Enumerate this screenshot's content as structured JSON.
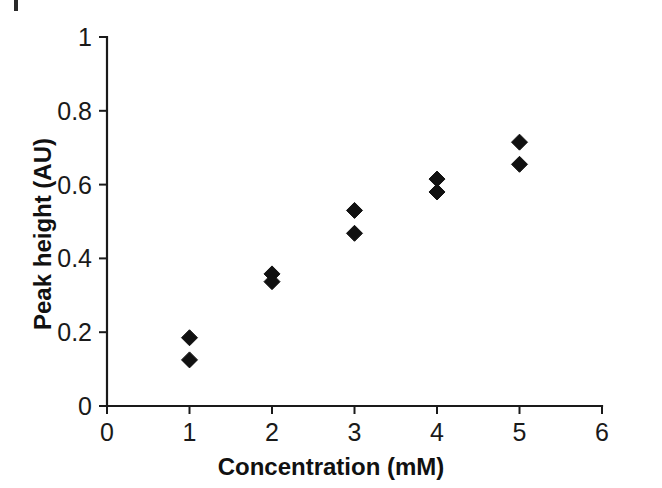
{
  "figure": {
    "background_color": "#ffffff",
    "ink_color": "#111111"
  },
  "chart_data": {
    "type": "scatter",
    "title": "",
    "subtitle": "",
    "xlabel": "Concentration (mM)",
    "ylabel": "Peak height (AU)",
    "xlim": [
      0,
      6
    ],
    "ylim": [
      0,
      1
    ],
    "xticks": [
      "0",
      "1",
      "2",
      "3",
      "4",
      "5",
      "6"
    ],
    "xtick_values": [
      0,
      1,
      2,
      3,
      4,
      5,
      6
    ],
    "yticks": [
      "0",
      "0.2",
      "0.4",
      "0.6",
      "0.8",
      "1"
    ],
    "ytick_values": [
      0,
      0.2,
      0.4,
      0.6,
      0.8,
      1
    ],
    "grid": false,
    "legend": null,
    "legend_position": "none",
    "marker_shape": "diamond",
    "marker_color": "#111111",
    "marker_size_px": 16,
    "x": [
      1,
      1,
      2,
      2,
      3,
      3,
      4,
      4,
      5,
      5
    ],
    "y": [
      0.185,
      0.125,
      0.358,
      0.337,
      0.53,
      0.468,
      0.615,
      0.58,
      0.715,
      0.655
    ],
    "points": [
      {
        "x": 1,
        "y": 0.185
      },
      {
        "x": 1,
        "y": 0.125
      },
      {
        "x": 2,
        "y": 0.358
      },
      {
        "x": 2,
        "y": 0.337
      },
      {
        "x": 3,
        "y": 0.53
      },
      {
        "x": 3,
        "y": 0.468
      },
      {
        "x": 4,
        "y": 0.615
      },
      {
        "x": 4,
        "y": 0.58
      },
      {
        "x": 5,
        "y": 0.715
      },
      {
        "x": 5,
        "y": 0.655
      }
    ],
    "annotations": []
  },
  "axes_geometry": {
    "left_px": 107,
    "right_px": 602,
    "top_px": 37,
    "bottom_px": 406
  }
}
